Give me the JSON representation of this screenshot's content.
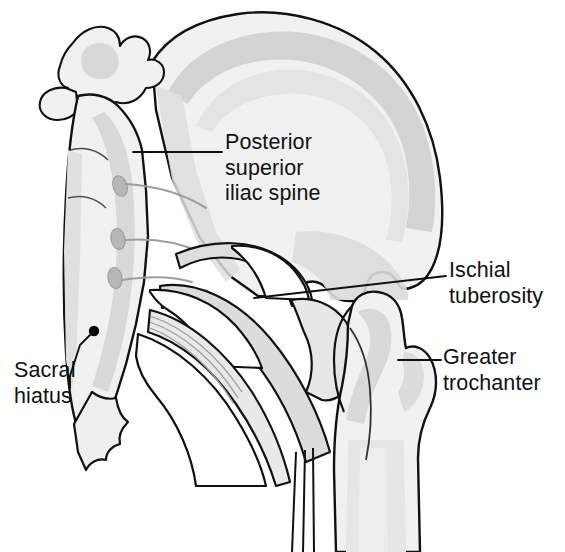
{
  "figure": {
    "view": "posterior",
    "background_color": "#ffffff",
    "outline_color": "#111111",
    "bone_fill_color": "#f1f1f1",
    "bone_shadow_color": "#d6d6d6",
    "bone_midtone_color": "#e2e2e2",
    "foramen_color": "#b9b9b9",
    "marker_color": "#000000"
  },
  "labels": [
    {
      "id": "posterior-superior-iliac-spine",
      "text": "Posterior\nsuperior\niliac spine",
      "lines": [
        "Posterior",
        "superior",
        "iliac spine"
      ]
    },
    {
      "id": "ischial-tuberosity",
      "text": "Ischial\ntuberosity",
      "lines": [
        "Ischial",
        "tuberosity"
      ]
    },
    {
      "id": "greater-trochanter",
      "text": "Greater\ntrochanter",
      "lines": [
        "Greater",
        "trochanter"
      ]
    },
    {
      "id": "sacral-hiatus",
      "text": "Sacral\nhiatus",
      "lines": [
        "Sacral",
        "hiatus"
      ]
    }
  ],
  "structures": [
    "sacrum",
    "lumbar vertebra",
    "ilium",
    "iliac crest",
    "posterior superior iliac spine",
    "greater sciatic notch",
    "sacrospinous ligament",
    "sacrotuberous ligament",
    "ischial tuberosity",
    "ischial ramus",
    "femur",
    "greater trochanter",
    "posterior sacral foramina",
    "sacral hiatus"
  ]
}
